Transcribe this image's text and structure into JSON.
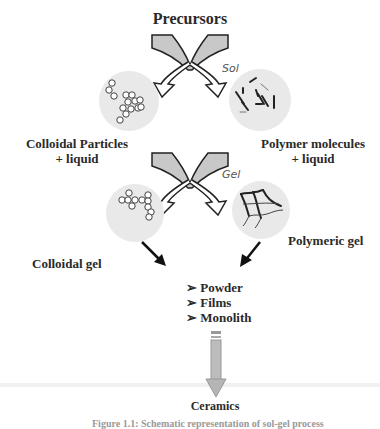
{
  "diagram": {
    "title": "Precursors",
    "stage_labels": {
      "sol": "Sol",
      "gel": "Gel"
    },
    "sol_stage": {
      "left": {
        "label_line1": "Colloidal Particles",
        "label_line2": "+ liquid",
        "icon": "colloidal-particles-circle"
      },
      "right": {
        "label_line1": "Polymer molecules",
        "label_line2": "+ liquid",
        "icon": "polymer-molecules-circle"
      }
    },
    "gel_stage": {
      "left": {
        "label": "Colloidal gel",
        "icon": "colloidal-gel-circle"
      },
      "right": {
        "label": "Polymeric gel",
        "icon": "polymeric-gel-network-circle"
      }
    },
    "products": {
      "bullet": "➢",
      "items": [
        "Powder",
        "Films",
        "Monolith"
      ]
    },
    "final": "Ceramics",
    "caption": "Figure 1.1: Schematic representation of sol-gel process",
    "colors": {
      "circle_fill": "#e9e9e9",
      "arrow_fill": "#c8c8c8",
      "arrow_stroke": "#222222",
      "down_arrow_fill": "#b5b5b5"
    }
  }
}
